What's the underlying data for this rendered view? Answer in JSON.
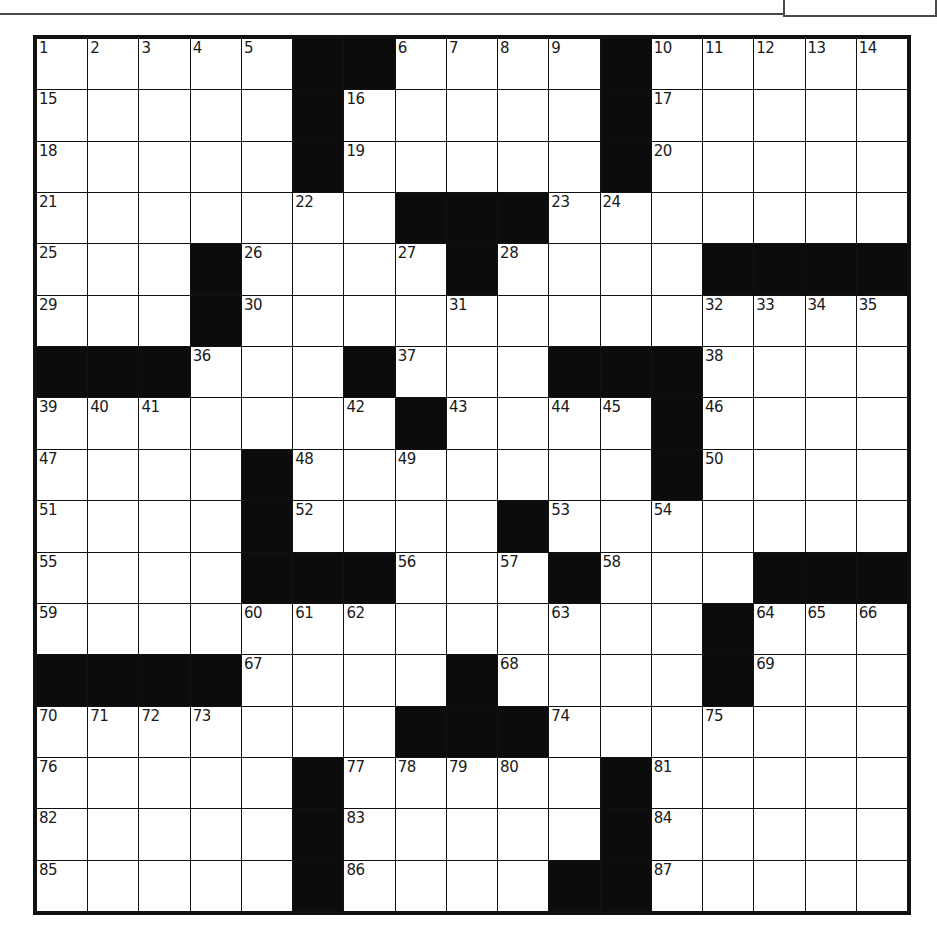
{
  "puzzle": {
    "type": "crossword",
    "rows": 17,
    "cols": 17,
    "colors": {
      "black_square": "#0c0c0c",
      "white_square": "#ffffff",
      "border": "#111111"
    },
    "grid": [
      [
        "1",
        "2",
        "3",
        "4",
        "5",
        "#",
        "#",
        "6",
        "7",
        "8",
        "9",
        "#",
        "10",
        "11",
        "12",
        "13",
        "14"
      ],
      [
        "15",
        "",
        "",
        "",
        "",
        "#",
        "16",
        "",
        "",
        "",
        "",
        "#",
        "17",
        "",
        "",
        "",
        ""
      ],
      [
        "18",
        "",
        "",
        "",
        "",
        "#",
        "19",
        "",
        "",
        "",
        "",
        "#",
        "20",
        "",
        "",
        "",
        ""
      ],
      [
        "21",
        "",
        "",
        "",
        "",
        "22",
        "",
        "#",
        "#",
        "#",
        "23",
        "24",
        "",
        "",
        "",
        "",
        ""
      ],
      [
        "25",
        "",
        "",
        "#",
        "26",
        "",
        "",
        "27",
        "#",
        "28",
        "",
        "",
        "",
        "#",
        "#",
        "#",
        "#"
      ],
      [
        "29",
        "",
        "",
        "#",
        "30",
        "",
        "",
        "",
        "31",
        "",
        "",
        "",
        "",
        "32",
        "33",
        "34",
        "35"
      ],
      [
        "#",
        "#",
        "#",
        "36",
        "",
        "",
        "#",
        "37",
        "",
        "",
        "#",
        "#",
        "#",
        "38",
        "",
        "",
        ""
      ],
      [
        "39",
        "40",
        "41",
        "",
        "",
        "",
        "42",
        "#",
        "43",
        "",
        "44",
        "45",
        "#",
        "46",
        "",
        "",
        ""
      ],
      [
        "47",
        "",
        "",
        "",
        "#",
        "48",
        "",
        "49",
        "",
        "",
        "",
        "",
        "#",
        "50",
        "",
        "",
        ""
      ],
      [
        "51",
        "",
        "",
        "",
        "#",
        "52",
        "",
        "",
        "",
        "#",
        "53",
        "",
        "54",
        "",
        "",
        "",
        ""
      ],
      [
        "55",
        "",
        "",
        "",
        "#",
        "#",
        "#",
        "56",
        "",
        "57",
        "#",
        "58",
        "",
        "",
        "#",
        "#",
        "#"
      ],
      [
        "59",
        "",
        "",
        "",
        "60",
        "61",
        "62",
        "",
        "",
        "",
        "63",
        "",
        "",
        "#",
        "64",
        "65",
        "66"
      ],
      [
        "#",
        "#",
        "#",
        "#",
        "67",
        "",
        "",
        "",
        "#",
        "68",
        "",
        "",
        "",
        "#",
        "69",
        "",
        ""
      ],
      [
        "70",
        "71",
        "72",
        "73",
        "",
        "",
        "",
        "#",
        "#",
        "#",
        "74",
        "",
        "",
        "75",
        "",
        "",
        ""
      ],
      [
        "76",
        "",
        "",
        "",
        "",
        "#",
        "77",
        "78",
        "79",
        "80",
        "",
        "#",
        "81",
        "",
        "",
        "",
        ""
      ],
      [
        "82",
        "",
        "",
        "",
        "",
        "#",
        "83",
        "",
        "",
        "",
        "",
        "#",
        "84",
        "",
        "",
        "",
        ""
      ],
      [
        "85",
        "",
        "",
        "",
        "",
        "#",
        "86",
        "",
        "",
        "",
        "#",
        "#",
        "87",
        "",
        "",
        "",
        ""
      ]
    ]
  }
}
